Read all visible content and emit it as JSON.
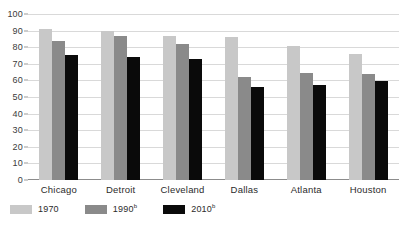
{
  "chart_data": {
    "type": "bar",
    "title": "",
    "subtitle": "",
    "xlabel": "",
    "ylabel": "",
    "ylim": [
      0,
      100
    ],
    "ytick_step": 10,
    "yticks": [
      "100",
      "90",
      "80",
      "70",
      "60",
      "50",
      "40",
      "30",
      "20",
      "10",
      "0"
    ],
    "grid": true,
    "legend_position": "bottom-left",
    "categories": [
      "Chicago",
      "Detroit",
      "Cleveland",
      "Dallas",
      "Atlanta",
      "Houston"
    ],
    "series": [
      {
        "name": "1970",
        "footnote": "",
        "color": "#c8c8c8",
        "values": [
          91,
          90,
          87,
          86,
          80.5,
          76
        ]
      },
      {
        "name": "1990",
        "footnote": "b",
        "color": "#8a8a8a",
        "values": [
          83.5,
          87,
          82,
          62,
          64.5,
          64
        ]
      },
      {
        "name": "2010",
        "footnote": "b",
        "color": "#0a0a0a",
        "values": [
          75.5,
          74,
          73,
          56,
          57.5,
          59.5
        ]
      }
    ]
  },
  "axis": {
    "baseline_color": "#8c8c8c",
    "gridline_color": "#d9d9d9"
  },
  "legend": {
    "entries": [
      {
        "label": "1970",
        "sup": "",
        "color": "#c8c8c8"
      },
      {
        "label": "1990",
        "sup": "b",
        "color": "#8a8a8a"
      },
      {
        "label": "2010",
        "sup": "b",
        "color": "#0a0a0a"
      }
    ]
  }
}
